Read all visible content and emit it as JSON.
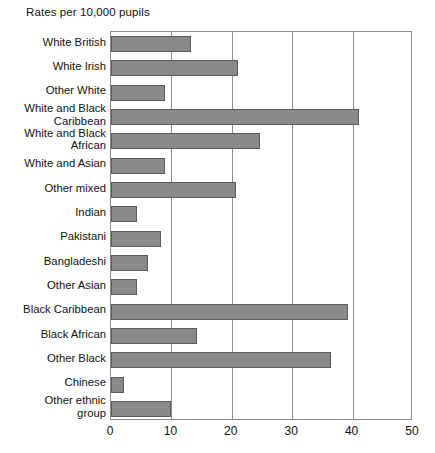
{
  "chart_data": {
    "type": "bar",
    "orientation": "horizontal",
    "title": "Rates per 10,000 pupils",
    "xlabel": "",
    "ylabel": "",
    "xlim": [
      0,
      50
    ],
    "xticks": [
      0,
      10,
      20,
      30,
      40,
      50
    ],
    "xtick_labels": [
      "0",
      "10",
      "20",
      "30",
      "40",
      "50"
    ],
    "grid": "vertical",
    "legend": "none",
    "bar_color": "#8a8a8a",
    "bar_edge_color": "#5c5c5c",
    "axis_color": "#8d8d8d",
    "categories": [
      "White British",
      "White Irish",
      "Other White",
      "White and Black\nCaribbean",
      "White and Black\nAfrican",
      "White and Asian",
      "Other mixed",
      "Indian",
      "Pakistani",
      "Bangladeshi",
      "Other Asian",
      "Black Caribbean",
      "Black African",
      "Other Black",
      "Chinese",
      "Other ethnic\ngroup"
    ],
    "values": [
      13.2,
      21.0,
      9.0,
      41.0,
      24.7,
      9.0,
      20.7,
      4.3,
      8.3,
      6.1,
      4.3,
      39.2,
      14.2,
      36.4,
      2.2,
      10.0
    ]
  }
}
